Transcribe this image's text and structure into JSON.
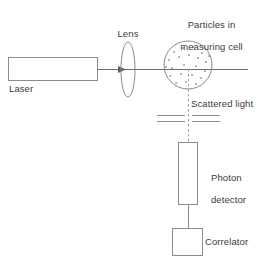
{
  "diagram": {
    "background_color": "#ffffff",
    "stroke_color": "#8c8c8c",
    "beam_color": "#6e6e6e",
    "text_color": "#3b3b3b",
    "particle_color": "#9a9a9a"
  },
  "labels": {
    "laser": "Laser",
    "lens": "Lens",
    "cell_line1": "Particles in",
    "cell_line2": "measuring cell",
    "scattered_light": "Scattered light",
    "photon_line1": "Photon",
    "photon_line2": "detector",
    "correlator": "Correlator"
  },
  "components": {
    "laser_box": {
      "x": 8,
      "y": 57,
      "width": 89,
      "height": 24
    },
    "lens": {
      "cx": 128,
      "cy": 69,
      "rx": 7,
      "ry": 27
    },
    "measuring_cell": {
      "cx": 188,
      "cy": 65,
      "r": 24
    },
    "photon_detector_box": {
      "x": 178,
      "y": 142,
      "width": 19,
      "height": 63
    },
    "correlator_box": {
      "x": 172,
      "y": 228,
      "width": 30,
      "height": 27
    },
    "beam": {
      "x1": 97,
      "y1": 69,
      "x2": 248,
      "y2": 69
    },
    "beam_arrow": {
      "x": 122,
      "y": 69
    },
    "scattered_beam": {
      "x": 188,
      "y1": 69,
      "y2": 142,
      "dashed": true
    },
    "detector_to_correlator": {
      "x": 188,
      "y1": 205,
      "y2": 228
    },
    "slits": [
      {
        "y": 115,
        "left_x1": 157,
        "left_x2": 185,
        "right_x1": 192,
        "right_x2": 220
      },
      {
        "y": 121,
        "left_x1": 157,
        "left_x2": 185,
        "right_x1": 192,
        "right_x2": 220
      }
    ]
  },
  "particles": [
    {
      "x": 174,
      "y": 52
    },
    {
      "x": 183,
      "y": 48
    },
    {
      "x": 193,
      "y": 47
    },
    {
      "x": 202,
      "y": 53
    },
    {
      "x": 169,
      "y": 60
    },
    {
      "x": 179,
      "y": 57
    },
    {
      "x": 189,
      "y": 55
    },
    {
      "x": 198,
      "y": 58
    },
    {
      "x": 206,
      "y": 62
    },
    {
      "x": 172,
      "y": 68
    },
    {
      "x": 184,
      "y": 65
    },
    {
      "x": 196,
      "y": 66
    },
    {
      "x": 205,
      "y": 71
    },
    {
      "x": 170,
      "y": 76
    },
    {
      "x": 181,
      "y": 74
    },
    {
      "x": 192,
      "y": 75
    },
    {
      "x": 201,
      "y": 78
    },
    {
      "x": 176,
      "y": 83
    },
    {
      "x": 186,
      "y": 82
    },
    {
      "x": 196,
      "y": 84
    },
    {
      "x": 166,
      "y": 67
    },
    {
      "x": 209,
      "y": 56
    }
  ]
}
